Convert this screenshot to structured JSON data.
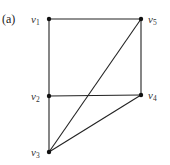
{
  "panel_label": "(a)",
  "graph": {
    "vertices": [
      {
        "id": "v1",
        "name": "v",
        "sub": "1",
        "x": 49,
        "y": 19,
        "label_x": 31,
        "label_y": 23
      },
      {
        "id": "v2",
        "name": "v",
        "sub": "2",
        "x": 49,
        "y": 96,
        "label_x": 31,
        "label_y": 100
      },
      {
        "id": "v3",
        "name": "v",
        "sub": "3",
        "x": 49,
        "y": 152,
        "label_x": 31,
        "label_y": 156
      },
      {
        "id": "v4",
        "name": "v",
        "sub": "4",
        "x": 141,
        "y": 95,
        "label_x": 148,
        "label_y": 99
      },
      {
        "id": "v5",
        "name": "v",
        "sub": "5",
        "x": 141,
        "y": 19,
        "label_x": 148,
        "label_y": 23
      }
    ],
    "edges": [
      [
        "v1",
        "v5"
      ],
      [
        "v1",
        "v2"
      ],
      [
        "v2",
        "v3"
      ],
      [
        "v5",
        "v4"
      ],
      [
        "v2",
        "v4"
      ],
      [
        "v5",
        "v3"
      ],
      [
        "v4",
        "v3"
      ]
    ]
  },
  "colors": {
    "edge": "#222222",
    "vertex": "#111111",
    "label": "#333333",
    "background": "#ffffff"
  }
}
